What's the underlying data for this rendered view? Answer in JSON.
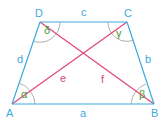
{
  "diagram": {
    "vertices": {
      "A": {
        "label": "A"
      },
      "B": {
        "label": "B"
      },
      "C": {
        "label": "C"
      },
      "D": {
        "label": "D"
      }
    },
    "sides": {
      "a": {
        "label": "a",
        "from": "A",
        "to": "B"
      },
      "b": {
        "label": "b",
        "from": "B",
        "to": "C"
      },
      "c": {
        "label": "c",
        "from": "C",
        "to": "D"
      },
      "d": {
        "label": "d",
        "from": "D",
        "to": "A"
      }
    },
    "diagonals": {
      "e": {
        "label": "e",
        "from": "A",
        "to": "C"
      },
      "f": {
        "label": "f",
        "from": "B",
        "to": "D"
      }
    },
    "angles": {
      "alpha": {
        "label": "α",
        "vertex": "A"
      },
      "beta": {
        "label": "β",
        "vertex": "B"
      },
      "gamma": {
        "label": "γ",
        "vertex": "C"
      },
      "delta": {
        "label": "δ",
        "vertex": "D"
      }
    },
    "colors": {
      "side": "#3fa9dd",
      "diagonal": "#e0457b",
      "angle_label": "#4a9a3a",
      "arc": "#9a9a9a",
      "side_label": "#3fa9dd"
    }
  }
}
